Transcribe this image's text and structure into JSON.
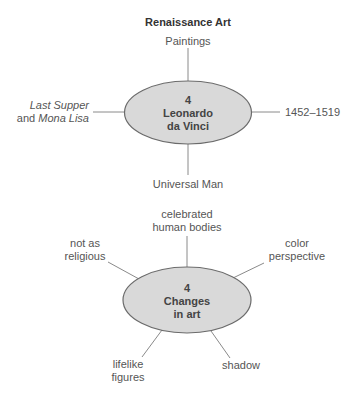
{
  "title": "Renaissance Art",
  "colors": {
    "ellipse_fill": "#d9d9d9",
    "ellipse_stroke": "#6b6b6b",
    "line": "#8a8a8a",
    "text": "#555555"
  },
  "diagram1": {
    "center": {
      "number": "4",
      "line1": "Leonardo",
      "line2": "da Vinci"
    },
    "top": "Paintings",
    "left": {
      "italic1": "Last Supper",
      "plain": "and ",
      "italic2": "Mona Lisa"
    },
    "right": "1452–1519",
    "bottom": "Universal Man"
  },
  "diagram2": {
    "center": {
      "number": "4",
      "line1": "Changes",
      "line2": "in art"
    },
    "top": {
      "line1": "celebrated",
      "line2": "human bodies"
    },
    "upper_left": {
      "line1": "not as",
      "line2": "religious"
    },
    "upper_right": {
      "line1": "color",
      "line2": "perspective"
    },
    "lower_left": {
      "line1": "lifelike",
      "line2": "figures"
    },
    "lower_right": "shadow"
  }
}
